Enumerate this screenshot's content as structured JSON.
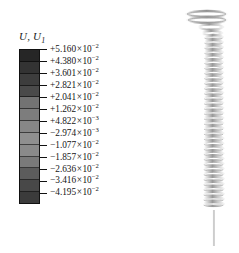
{
  "figure": {
    "name": "contour-plot-coil-spring",
    "background": "#ffffff"
  },
  "legend": {
    "title": "U, U",
    "title_subscript": "1",
    "variable": "U,U1",
    "colormap": "grayscale-banded",
    "band_count": 13,
    "band_colors": [
      "#262626",
      "#333333",
      "#3d3d3d",
      "#4a4a4a",
      "#737373",
      "#7d7d7d",
      "#878787",
      "#8f8f8f",
      "#8a8a8a",
      "#7a7a7a",
      "#5c5c5c",
      "#484848",
      "#3b3b3b"
    ],
    "ticks": [
      {
        "sign": "+",
        "mantissa": "5.160",
        "exponent": "-2",
        "text": "+5.160×10⁻²",
        "value": 0.0516
      },
      {
        "sign": "+",
        "mantissa": "4.380",
        "exponent": "-2",
        "text": "+4.380×10⁻²",
        "value": 0.0438
      },
      {
        "sign": "+",
        "mantissa": "3.601",
        "exponent": "-2",
        "text": "+3.601×10⁻²",
        "value": 0.03601
      },
      {
        "sign": "+",
        "mantissa": "2.821",
        "exponent": "-2",
        "text": "+2.821×10⁻²",
        "value": 0.02821
      },
      {
        "sign": "+",
        "mantissa": "2.041",
        "exponent": "-2",
        "text": "+2.041×10⁻²",
        "value": 0.02041
      },
      {
        "sign": "+",
        "mantissa": "1.262",
        "exponent": "-2",
        "text": "+1.262×10⁻²",
        "value": 0.01262
      },
      {
        "sign": "+",
        "mantissa": "4.822",
        "exponent": "-3",
        "text": "+4.822×10⁻³",
        "value": 0.004822
      },
      {
        "sign": "-",
        "mantissa": "2.974",
        "exponent": "-3",
        "text": "−2.974×10⁻³",
        "value": -0.002974
      },
      {
        "sign": "-",
        "mantissa": "1.077",
        "exponent": "-2",
        "text": "−1.077×10⁻²",
        "value": -0.01077
      },
      {
        "sign": "-",
        "mantissa": "1.857",
        "exponent": "-2",
        "text": "−1.857×10⁻²",
        "value": -0.01857
      },
      {
        "sign": "-",
        "mantissa": "2.636",
        "exponent": "-2",
        "text": "−2.636×10⁻²",
        "value": -0.02636
      },
      {
        "sign": "-",
        "mantissa": "3.416",
        "exponent": "-2",
        "text": "−3.416×10⁻²",
        "value": -0.03416
      },
      {
        "sign": "-",
        "mantissa": "4.195",
        "exponent": "-2",
        "text": "−4.195×10⁻²",
        "value": -0.04195
      }
    ]
  },
  "model": {
    "name": "helical-coil-spring",
    "description": "vertical helical compression spring with flattened top end coil and straight lower tail",
    "coil_turns": 34,
    "top_flat_turns": 3,
    "line_color": "#8c8c8c",
    "shade_color": "#bfbfbf"
  },
  "chart_data": {
    "type": "heatmap",
    "title": "U, U1",
    "xlabel": "",
    "ylabel": "",
    "legend_position": "left",
    "grid": false,
    "colormap": "grayscale-banded",
    "categories": [
      "+5.160×10⁻²",
      "+4.380×10⁻²",
      "+3.601×10⁻²",
      "+2.821×10⁻²",
      "+2.041×10⁻²",
      "+1.262×10⁻²",
      "+4.822×10⁻³",
      "−2.974×10⁻³",
      "−1.077×10⁻²",
      "−1.857×10⁻²",
      "−2.636×10⁻²",
      "−3.416×10⁻²",
      "−4.195×10⁻²"
    ],
    "values": [
      0.0516,
      0.0438,
      0.03601,
      0.02821,
      0.02041,
      0.01262,
      0.004822,
      -0.002974,
      -0.01077,
      -0.01857,
      -0.02636,
      -0.03416,
      -0.04195
    ],
    "ylim": [
      -0.04195,
      0.0516
    ]
  }
}
